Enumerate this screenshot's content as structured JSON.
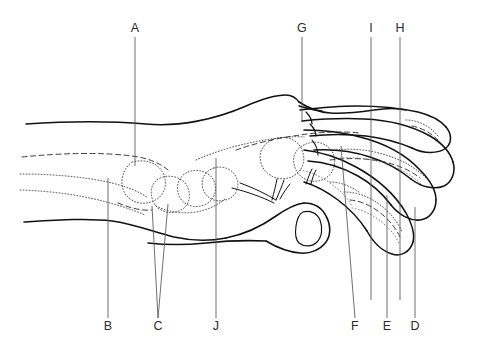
{
  "figure": {
    "background_color": "#ffffff",
    "line_color": "#111111",
    "label_color": "#2b2b2b",
    "leader_color": "#555555",
    "width": 480,
    "height": 349
  },
  "labels": {
    "top": [
      {
        "id": "A",
        "text": "A",
        "x": 135,
        "y": 31
      },
      {
        "id": "G",
        "text": "G",
        "x": 302,
        "y": 31
      },
      {
        "id": "I",
        "text": "I",
        "x": 371,
        "y": 31
      },
      {
        "id": "H",
        "text": "H",
        "x": 400,
        "y": 31
      }
    ],
    "bottom": [
      {
        "id": "B",
        "text": "B",
        "x": 108,
        "y": 327
      },
      {
        "id": "C",
        "text": "C",
        "x": 158,
        "y": 327
      },
      {
        "id": "J",
        "text": "J",
        "x": 216,
        "y": 327
      },
      {
        "id": "F",
        "text": "F",
        "x": 355,
        "y": 327
      },
      {
        "id": "E",
        "text": "E",
        "x": 387,
        "y": 327
      },
      {
        "id": "D",
        "text": "D",
        "x": 415,
        "y": 327
      }
    ]
  },
  "leader_lines": [
    {
      "for": "A",
      "path": "M135 37 L135 166"
    },
    {
      "for": "G",
      "path": "M302 37 L302 122"
    },
    {
      "for": "I",
      "path": "M371 37 L371 120 L371 218 L371 300"
    },
    {
      "for": "H",
      "path": "M400 37 L400 120 L400 215 L400 300"
    },
    {
      "for": "B",
      "path": "M108 318 L108 178"
    },
    {
      "for": "C",
      "path": "M158 318 L152 206 M158 318 L168 204"
    },
    {
      "for": "J",
      "path": "M216 318 L216 158"
    },
    {
      "for": "F",
      "path": "M355 318 L341 146"
    },
    {
      "for": "E",
      "path": "M387 318 L387 195"
    },
    {
      "for": "D",
      "path": "M415 318 L415 207"
    }
  ],
  "illustration_parts": [
    "forearm-dorsal-contour",
    "forearm-palmar-contour",
    "radius-bone",
    "ulna-bone",
    "carpal-bones",
    "metacarpal-bones",
    "proximal-phalanges",
    "middle-phalanges",
    "distal-phalanges",
    "thumb-contour",
    "thumbnail",
    "index-finger-contour",
    "middle-finger-contour",
    "ring-finger-contour",
    "little-finger-contour",
    "tendon-lines"
  ]
}
